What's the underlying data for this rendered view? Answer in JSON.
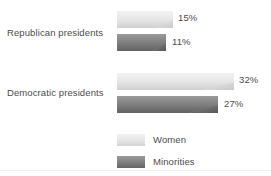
{
  "chart_data": {
    "type": "bar",
    "orientation": "horizontal",
    "title": "",
    "subtitle": "",
    "xlabel": "",
    "ylabel": "",
    "grid": false,
    "xlim": [
      0,
      40
    ],
    "categories": [
      "Republican presidents",
      "Democratic presidents"
    ],
    "series": [
      {
        "name": "Women",
        "color": "#e4e4e4",
        "values": [
          15,
          32
        ],
        "value_labels": [
          "15%",
          "32%"
        ]
      },
      {
        "name": "Minorities",
        "color": "#7e7e7e",
        "values": [
          11,
          27
        ],
        "value_labels": [
          "11%",
          "27%"
        ]
      }
    ],
    "legend": {
      "position": "bottom",
      "entries": [
        {
          "label": "Women",
          "color": "#e4e4e4"
        },
        {
          "label": "Minorities",
          "color": "#7e7e7e"
        }
      ]
    }
  },
  "labels": {
    "republican": "Republican presidents",
    "democratic": "Democratic presidents"
  },
  "values": {
    "rep_women": "15%",
    "rep_minorities": "11%",
    "dem_women": "32%",
    "dem_minorities": "27%"
  },
  "legend": {
    "women": "Women",
    "minorities": "Minorities"
  },
  "colors": {
    "women": "#e4e4e4",
    "minorities": "#7e7e7e",
    "text": "#4c4c4c",
    "background": "#ffffff",
    "rule": "#f0f0f2"
  }
}
